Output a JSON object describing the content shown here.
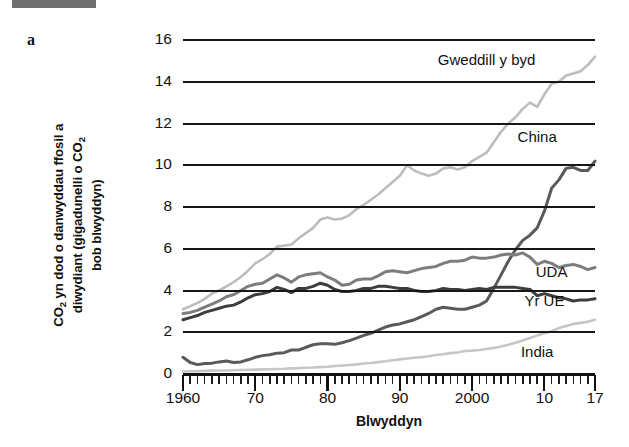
{
  "panel": {
    "letter": "a",
    "top_bar_color": "#6f6f6f"
  },
  "axis": {
    "ylabel_line1": "CO",
    "ylabel_sub1": "2",
    "ylabel_rest1": " yn dod o danwyddau ffosil a",
    "ylabel_line2": "diwydiant (gigadunelli o CO",
    "ylabel_sub2": "2",
    "ylabel_line3": "bob blwyddyn)",
    "ylabel_full": "CO2 yn dod o danwyddau ffosil a diwydiant (gigadunelli o CO2 bob blwyddyn)",
    "xlabel": "Blwyddyn"
  },
  "chart_data": {
    "type": "line",
    "title": "",
    "subtitle": "",
    "xlabel": "Blwyddyn",
    "ylabel": "CO2 yn dod o danwyddau ffosil a diwydiant (gigadunelli o CO2 bob blwyddyn)",
    "xlim": [
      1960,
      2017
    ],
    "ylim": [
      0,
      16
    ],
    "grid": true,
    "legend_position": "inline-labels",
    "x_tick_labels": [
      "1960",
      "70",
      "80",
      "90",
      "2000",
      "10",
      "17"
    ],
    "x_tick_values": [
      1960,
      1970,
      1980,
      1990,
      2000,
      2010,
      2017
    ],
    "x_minor_tick_step": 1,
    "y_tick_labels": [
      "0",
      "2",
      "4",
      "6",
      "8",
      "10",
      "12",
      "14",
      "16"
    ],
    "y_tick_values": [
      0,
      2,
      4,
      6,
      8,
      10,
      12,
      14,
      16
    ],
    "x": [
      1960,
      1961,
      1962,
      1963,
      1964,
      1965,
      1966,
      1967,
      1968,
      1969,
      1970,
      1971,
      1972,
      1973,
      1974,
      1975,
      1976,
      1977,
      1978,
      1979,
      1980,
      1981,
      1982,
      1983,
      1984,
      1985,
      1986,
      1987,
      1988,
      1989,
      1990,
      1991,
      1992,
      1993,
      1994,
      1995,
      1996,
      1997,
      1998,
      1999,
      2000,
      2001,
      2002,
      2003,
      2004,
      2005,
      2006,
      2007,
      2008,
      2009,
      2010,
      2011,
      2012,
      2013,
      2014,
      2015,
      2016,
      2017
    ],
    "series": [
      {
        "name": "Gweddill y byd",
        "color": "#bdbdbd",
        "label_x": 2002,
        "label_y": 15.0,
        "values": [
          3.1,
          3.25,
          3.4,
          3.6,
          3.85,
          4.0,
          4.2,
          4.4,
          4.65,
          4.95,
          5.3,
          5.5,
          5.75,
          6.1,
          6.15,
          6.2,
          6.5,
          6.75,
          7.0,
          7.4,
          7.5,
          7.4,
          7.45,
          7.6,
          7.9,
          8.1,
          8.35,
          8.6,
          8.9,
          9.2,
          9.5,
          10.0,
          9.75,
          9.6,
          9.5,
          9.6,
          9.85,
          9.9,
          9.8,
          9.9,
          10.2,
          10.4,
          10.6,
          11.1,
          11.6,
          12.0,
          12.3,
          12.7,
          13.0,
          12.8,
          13.4,
          13.9,
          14.0,
          14.3,
          14.4,
          14.5,
          14.8,
          15.2
        ]
      },
      {
        "name": "China",
        "color": "#5a5a5a",
        "label_x": 2009,
        "label_y": 11.3,
        "values": [
          0.8,
          0.55,
          0.45,
          0.5,
          0.52,
          0.58,
          0.62,
          0.55,
          0.58,
          0.68,
          0.8,
          0.88,
          0.92,
          1.0,
          1.02,
          1.15,
          1.15,
          1.28,
          1.4,
          1.45,
          1.45,
          1.42,
          1.5,
          1.6,
          1.72,
          1.85,
          1.95,
          2.1,
          2.25,
          2.35,
          2.4,
          2.5,
          2.6,
          2.75,
          2.9,
          3.1,
          3.2,
          3.15,
          3.1,
          3.1,
          3.2,
          3.3,
          3.5,
          4.1,
          4.75,
          5.4,
          5.95,
          6.4,
          6.65,
          7.0,
          7.8,
          8.9,
          9.3,
          9.85,
          9.9,
          9.75,
          9.75,
          10.2
        ]
      },
      {
        "name": "UDA",
        "color": "#7d7d7d",
        "label_x": 2011,
        "label_y": 4.85,
        "values": [
          2.9,
          2.95,
          3.05,
          3.2,
          3.35,
          3.5,
          3.7,
          3.8,
          4.0,
          4.2,
          4.3,
          4.35,
          4.55,
          4.75,
          4.6,
          4.4,
          4.65,
          4.75,
          4.8,
          4.85,
          4.65,
          4.5,
          4.25,
          4.3,
          4.5,
          4.55,
          4.55,
          4.7,
          4.9,
          4.95,
          4.9,
          4.85,
          4.95,
          5.05,
          5.1,
          5.15,
          5.3,
          5.4,
          5.4,
          5.45,
          5.6,
          5.55,
          5.55,
          5.6,
          5.7,
          5.75,
          5.7,
          5.8,
          5.6,
          5.25,
          5.4,
          5.3,
          5.1,
          5.2,
          5.25,
          5.15,
          5.0,
          5.1
        ]
      },
      {
        "name": "Yr UE",
        "color": "#3d3d3d",
        "label_x": 2010,
        "label_y": 3.45,
        "values": [
          2.6,
          2.7,
          2.8,
          2.95,
          3.05,
          3.15,
          3.25,
          3.3,
          3.45,
          3.65,
          3.8,
          3.85,
          3.95,
          4.15,
          4.05,
          3.9,
          4.1,
          4.1,
          4.2,
          4.35,
          4.25,
          4.05,
          3.95,
          3.95,
          4.0,
          4.1,
          4.1,
          4.2,
          4.2,
          4.15,
          4.1,
          4.1,
          4.0,
          3.95,
          3.95,
          4.0,
          4.1,
          4.05,
          4.05,
          4.0,
          4.05,
          4.1,
          4.05,
          4.15,
          4.15,
          4.15,
          4.15,
          4.1,
          4.05,
          3.75,
          3.85,
          3.75,
          3.65,
          3.6,
          3.5,
          3.55,
          3.55,
          3.6
        ]
      },
      {
        "name": "India",
        "color": "#c6c6c6",
        "label_x": 2009,
        "label_y": 1.0,
        "values": [
          0.12,
          0.13,
          0.14,
          0.15,
          0.16,
          0.17,
          0.17,
          0.18,
          0.19,
          0.2,
          0.21,
          0.22,
          0.23,
          0.24,
          0.25,
          0.27,
          0.28,
          0.3,
          0.31,
          0.33,
          0.35,
          0.38,
          0.4,
          0.43,
          0.46,
          0.5,
          0.53,
          0.57,
          0.61,
          0.66,
          0.7,
          0.74,
          0.78,
          0.81,
          0.85,
          0.91,
          0.95,
          1.0,
          1.03,
          1.1,
          1.12,
          1.15,
          1.2,
          1.25,
          1.32,
          1.4,
          1.5,
          1.6,
          1.72,
          1.85,
          1.95,
          2.05,
          2.2,
          2.3,
          2.4,
          2.45,
          2.5,
          2.6
        ]
      }
    ]
  }
}
